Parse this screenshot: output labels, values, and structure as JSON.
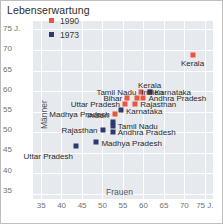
{
  "title": "Lebenserwartung",
  "colors": {
    "series_1990": "#e8563c",
    "series_1973": "#2e3a6e",
    "plot_bg": "#e6e9ee",
    "grid": "#ffffff",
    "tick_text": "#6d7278"
  },
  "axes": {
    "x_name": "Frauen",
    "y_name": "Männer",
    "x_ticks": [
      "35",
      "40",
      "45",
      "50",
      "55",
      "60",
      "65",
      "70",
      "75 J."
    ],
    "y_ticks": [
      "75 J.",
      "70",
      "65",
      "60",
      "55",
      "50",
      "45",
      "40",
      "35"
    ],
    "x_min": 33,
    "x_max": 77,
    "y_min": 33,
    "y_max": 77
  },
  "legend": {
    "items": [
      {
        "label": "1990",
        "color": "#e8563c"
      },
      {
        "label": "1973",
        "color": "#2e3a6e"
      }
    ]
  },
  "chart_data": {
    "type": "scatter",
    "title": "Lebenserwartung",
    "xlabel": "Frauen",
    "ylabel": "Männer",
    "xlim": [
      33,
      77
    ],
    "ylim": [
      33,
      77
    ],
    "grid": true,
    "legend_position": "top-left",
    "unit": "Jahre",
    "series": [
      {
        "name": "1990",
        "color": "#e8563c",
        "points": [
          {
            "label": "Kerala",
            "x": 72.0,
            "y": 68.5,
            "label_pos": "below"
          },
          {
            "label": "Karnataka",
            "x": 61.5,
            "y": 59.5,
            "label_pos": "right"
          },
          {
            "label": "Tamil Nadu",
            "x": 59.5,
            "y": 59.5,
            "label_pos": "left"
          },
          {
            "label": "Andhra Pradesh",
            "x": 60.0,
            "y": 58.0,
            "label_pos": "right"
          },
          {
            "label": "Indien",
            "x": 58.5,
            "y": 58.0,
            "label_pos": "right-above"
          },
          {
            "label": "Bihar",
            "x": 56.0,
            "y": 58.0,
            "label_pos": "left"
          },
          {
            "label": "Rajasthan",
            "x": 58.0,
            "y": 56.5,
            "label_pos": "right"
          },
          {
            "label": "Uttar Pradesh",
            "x": 55.5,
            "y": 56.5,
            "label_pos": "left"
          },
          {
            "label": "Madhya Pradesh",
            "x": 53.0,
            "y": 54.0,
            "label_pos": "left"
          }
        ]
      },
      {
        "name": "1973",
        "color": "#2e3a6e",
        "points": [
          {
            "label": "Kerala",
            "x": 61.5,
            "y": 59.5,
            "label_pos": "above"
          },
          {
            "label": "Karnataka",
            "x": 54.5,
            "y": 55.0,
            "label_pos": "right-below"
          },
          {
            "label": "Tamil Nadu",
            "x": 52.5,
            "y": 51.0,
            "label_pos": "right"
          },
          {
            "label": "Andhra Pradesh",
            "x": 52.5,
            "y": 49.5,
            "label_pos": "right"
          },
          {
            "label": "Indien",
            "x": 52.5,
            "y": 52.0,
            "label_pos": "left-above"
          },
          {
            "label": "Rajasthan",
            "x": 50.0,
            "y": 50.0,
            "label_pos": "left"
          },
          {
            "label": "Madhya Pradesh",
            "x": 48.5,
            "y": 47.0,
            "label_pos": "right-below"
          },
          {
            "label": "Uttar Pradesh",
            "x": 43.5,
            "y": 46.0,
            "label_pos": "below-left"
          }
        ]
      }
    ]
  }
}
